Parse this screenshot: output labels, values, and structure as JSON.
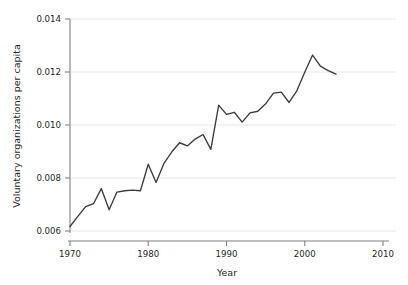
{
  "chart_data": {
    "type": "line",
    "title": "",
    "subtitle": "",
    "xlabel": "Year",
    "ylabel": "Voluntary organizations per capita",
    "xlim": [
      1968,
      2011
    ],
    "ylim": [
      0.0058,
      0.0142
    ],
    "xticks": [
      1970,
      1980,
      1990,
      2000,
      2010
    ],
    "xtick_labels": [
      "1970",
      "1980",
      "1990",
      "2000",
      "2010"
    ],
    "yticks": [
      0.006,
      0.008,
      0.01,
      0.012,
      0.014
    ],
    "ytick_labels": [
      "0.006",
      "0.008",
      "0.010",
      "0.012",
      "0.014"
    ],
    "grid": "horizontal",
    "legend": "none",
    "line_color": "#3b3b3b",
    "grid_color": "#e8e8ea",
    "axis_color": "#808080",
    "background_color": "#ffffff",
    "x": [
      1970,
      1971,
      1972,
      1973,
      1974,
      1975,
      1976,
      1977,
      1978,
      1979,
      1980,
      1981,
      1982,
      1983,
      1984,
      1985,
      1986,
      1987,
      1988,
      1989,
      1990,
      1991,
      1992,
      1993,
      1994,
      1995,
      1996,
      1997,
      1998,
      1999,
      2000,
      2001,
      2002,
      2003,
      2004
    ],
    "values": [
      0.00617,
      0.00655,
      0.00692,
      0.00703,
      0.0076,
      0.0068,
      0.00747,
      0.00752,
      0.00754,
      0.00752,
      0.00852,
      0.00783,
      0.00855,
      0.00898,
      0.00933,
      0.00921,
      0.00947,
      0.00964,
      0.00908,
      0.01075,
      0.0104,
      0.01048,
      0.01011,
      0.01046,
      0.01052,
      0.0108,
      0.0112,
      0.01124,
      0.01085,
      0.0113,
      0.01199,
      0.01264,
      0.01222,
      0.01205,
      0.01192
    ],
    "series": [
      {
        "name": "Voluntary organizations per capita",
        "values": [
          0.00617,
          0.00655,
          0.00692,
          0.00703,
          0.0076,
          0.0068,
          0.00747,
          0.00752,
          0.00754,
          0.00752,
          0.00852,
          0.00783,
          0.00855,
          0.00898,
          0.00933,
          0.00921,
          0.00947,
          0.00964,
          0.00908,
          0.01075,
          0.0104,
          0.01048,
          0.01011,
          0.01046,
          0.01052,
          0.0108,
          0.0112,
          0.01124,
          0.01085,
          0.0113,
          0.01199,
          0.01264,
          0.01222,
          0.01205,
          0.01192
        ]
      }
    ]
  }
}
